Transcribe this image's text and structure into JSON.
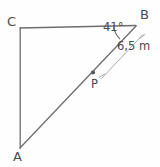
{
  "figure": {
    "type": "geometry-diagram",
    "shape": "triangle",
    "background_color": "#fefefe",
    "stroke_color": "#6d6d6d",
    "text_color": "#4a4a4a",
    "vertices": [
      {
        "name": "C",
        "label": "C",
        "x": 20,
        "y": 28
      },
      {
        "name": "B",
        "label": "B",
        "x": 136,
        "y": 25
      },
      {
        "name": "A",
        "label": "A",
        "x": 20,
        "y": 148
      }
    ],
    "points": [
      {
        "name": "P",
        "label": "P",
        "x": 93,
        "y": 72,
        "on_segment": "AB"
      }
    ],
    "angles": [
      {
        "at_vertex": "B",
        "label": "41°",
        "value": 41,
        "unit": "degrees"
      }
    ],
    "measurements": [
      {
        "segment": "PB",
        "label": "6,5 m",
        "value": "6,5",
        "unit": "m"
      }
    ],
    "segments": [
      {
        "name": "CB",
        "from": "C",
        "to": "B"
      },
      {
        "name": "CA",
        "from": "C",
        "to": "A"
      },
      {
        "name": "AB",
        "from": "A",
        "to": "B"
      }
    ]
  }
}
